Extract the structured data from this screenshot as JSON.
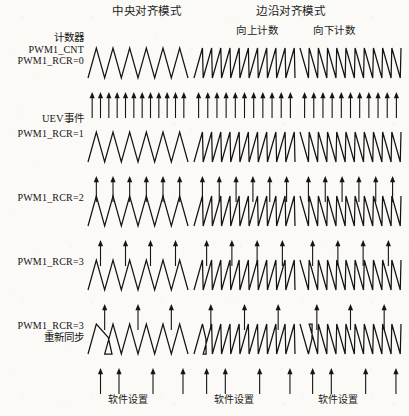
{
  "page": {
    "background": "#fbfaf7",
    "ink": "#1a1a1a",
    "width": 409,
    "height": 416
  },
  "headers": {
    "center_mode": "中央对齐模式",
    "edge_mode": "边沿对齐模式",
    "count_up": "向上计数",
    "count_down": "向下计数"
  },
  "labels": {
    "counter": "计数器",
    "pwm_cnt": "PWM1_CNT",
    "rcr0": "PWM1_RCR=0",
    "uev_event": "UEV事件",
    "rcr1": "PWM1_RCR=1",
    "rcr2": "PWM1_RCR=2",
    "rcr3": "PWM1_RCR=3",
    "rcr3_resync": "PWM1_RCR=3",
    "resync": "重新同步"
  },
  "captions": {
    "software_setting_center": "软件设置",
    "software_setting_up": "软件设置",
    "software_setting_down": "软件设置"
  },
  "chart_data": {
    "type": "line",
    "xlabel": "",
    "ylabel": "",
    "grid": false,
    "legend": "none",
    "columns": [
      {
        "key": "center",
        "header": "中央对齐模式",
        "sub": "",
        "waveform": "triangle",
        "periods": 6,
        "x": 88,
        "width": 100
      },
      {
        "key": "edge_up",
        "header": "边沿对齐模式",
        "sub": "向上计数",
        "waveform": "sawtooth-up",
        "periods": 11,
        "x": 194,
        "width": 101
      },
      {
        "key": "edge_down",
        "header": "边沿对齐模式",
        "sub": "向下计数",
        "waveform": "sawtooth-down",
        "periods": 11,
        "x": 300,
        "width": 101
      }
    ],
    "rows": [
      {
        "key": "rcr0",
        "label": [
          "计数器",
          "PWM1_CNT",
          "PWM1_RCR=0"
        ],
        "rcr": 0,
        "uev_arrows": {
          "center": 12,
          "edge_up": 11,
          "edge_down": 11
        },
        "note": "每个计数周期产生一次更新事件"
      },
      {
        "key": "rcr1",
        "label": [
          "PWM1_RCR=1"
        ],
        "rcr": 1,
        "uev_arrows": {
          "center": 6,
          "edge_up": 6,
          "edge_down": 6
        },
        "note": "每两个周期产生一次更新事件"
      },
      {
        "key": "rcr2",
        "label": [
          "PWM1_RCR=2"
        ],
        "rcr": 2,
        "uev_arrows": {
          "center": 4,
          "edge_up": 4,
          "edge_down": 4
        },
        "note": "每三个周期产生一次更新事件"
      },
      {
        "key": "rcr3",
        "label": [
          "PWM1_RCR=3"
        ],
        "rcr": 3,
        "uev_arrows": {
          "center": 3,
          "edge_up": 3,
          "edge_down": 3
        },
        "note": "每四个周期产生一次更新事件"
      },
      {
        "key": "rcr3_resync",
        "label": [
          "PWM1_RCR=3",
          "重新同步"
        ],
        "rcr": 3,
        "uev_arrows": {
          "center": 4,
          "edge_up": 4,
          "edge_down": 4
        },
        "resynchronized": true,
        "note": "软件设置后重新同步，计数周期被截断"
      }
    ],
    "annotations": [
      {
        "text": "UEV事件",
        "target": "arrow-rows"
      },
      {
        "text": "软件设置",
        "target": "bottom-center"
      },
      {
        "text": "软件设置",
        "target": "bottom-up"
      },
      {
        "text": "软件设置",
        "target": "bottom-down"
      }
    ]
  }
}
